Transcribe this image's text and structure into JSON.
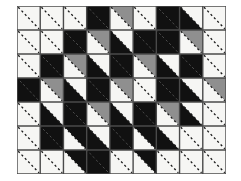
{
  "figure": {
    "type": "geometric-tiling",
    "grid": {
      "columns": 9,
      "rows": 7
    },
    "cell_size_px": 23.2,
    "origin_px": {
      "x": 17,
      "y": 6
    },
    "canvas_px": {
      "width": 241,
      "height": 181
    },
    "colors": {
      "background": "#ffffff",
      "white": "#f6f6f4",
      "gray": "#8f8f8f",
      "black": "#111111",
      "grid_line": "#4a4a4a",
      "dash_line": "#1a1a1a"
    },
    "diagonal_direction": "top-left-to-bottom-right",
    "legend": [
      {
        "key": "W",
        "label": "white triangle",
        "color": "#f6f6f4"
      },
      {
        "key": "G",
        "label": "gray triangle",
        "color": "#8f8f8f"
      },
      {
        "key": "K",
        "label": "black triangle",
        "color": "#111111"
      }
    ],
    "cells": [
      [
        {
          "upper": "W",
          "lower": "W"
        },
        {
          "upper": "W",
          "lower": "W"
        },
        {
          "upper": "W",
          "lower": "W"
        },
        {
          "upper": "K",
          "lower": "K"
        },
        {
          "upper": "G",
          "lower": "W"
        },
        {
          "upper": "W",
          "lower": "W"
        },
        {
          "upper": "K",
          "lower": "K"
        },
        {
          "upper": "W",
          "lower": "K"
        },
        {
          "upper": "W",
          "lower": "W"
        }
      ],
      [
        {
          "upper": "W",
          "lower": "W"
        },
        {
          "upper": "W",
          "lower": "W"
        },
        {
          "upper": "K",
          "lower": "K"
        },
        {
          "upper": "G",
          "lower": "W"
        },
        {
          "upper": "W",
          "lower": "K"
        },
        {
          "upper": "K",
          "lower": "K"
        },
        {
          "upper": "K",
          "lower": "K"
        },
        {
          "upper": "G",
          "lower": "W"
        },
        {
          "upper": "W",
          "lower": "W"
        }
      ],
      [
        {
          "upper": "W",
          "lower": "W"
        },
        {
          "upper": "K",
          "lower": "K"
        },
        {
          "upper": "G",
          "lower": "W"
        },
        {
          "upper": "W",
          "lower": "K"
        },
        {
          "upper": "K",
          "lower": "K"
        },
        {
          "upper": "G",
          "lower": "W"
        },
        {
          "upper": "W",
          "lower": "K"
        },
        {
          "upper": "K",
          "lower": "K"
        },
        {
          "upper": "W",
          "lower": "W"
        }
      ],
      [
        {
          "upper": "K",
          "lower": "K"
        },
        {
          "upper": "G",
          "lower": "W"
        },
        {
          "upper": "W",
          "lower": "K"
        },
        {
          "upper": "K",
          "lower": "K"
        },
        {
          "upper": "G",
          "lower": "W"
        },
        {
          "upper": "W",
          "lower": "W"
        },
        {
          "upper": "K",
          "lower": "K"
        },
        {
          "upper": "W",
          "lower": "K"
        },
        {
          "upper": "G",
          "lower": "W"
        }
      ],
      [
        {
          "upper": "W",
          "lower": "W"
        },
        {
          "upper": "W",
          "lower": "K"
        },
        {
          "upper": "K",
          "lower": "K"
        },
        {
          "upper": "G",
          "lower": "W"
        },
        {
          "upper": "W",
          "lower": "K"
        },
        {
          "upper": "K",
          "lower": "K"
        },
        {
          "upper": "G",
          "lower": "W"
        },
        {
          "upper": "W",
          "lower": "K"
        },
        {
          "upper": "W",
          "lower": "W"
        }
      ],
      [
        {
          "upper": "W",
          "lower": "W"
        },
        {
          "upper": "K",
          "lower": "K"
        },
        {
          "upper": "K",
          "lower": "W"
        },
        {
          "upper": "W",
          "lower": "K"
        },
        {
          "upper": "K",
          "lower": "K"
        },
        {
          "upper": "K",
          "lower": "W"
        },
        {
          "upper": "W",
          "lower": "K"
        },
        {
          "upper": "W",
          "lower": "W"
        },
        {
          "upper": "W",
          "lower": "W"
        }
      ],
      [
        {
          "upper": "W",
          "lower": "W"
        },
        {
          "upper": "W",
          "lower": "W"
        },
        {
          "upper": "K",
          "lower": "W"
        },
        {
          "upper": "K",
          "lower": "K"
        },
        {
          "upper": "W",
          "lower": "W"
        },
        {
          "upper": "K",
          "lower": "W"
        },
        {
          "upper": "W",
          "lower": "W"
        },
        {
          "upper": "W",
          "lower": "W"
        },
        {
          "upper": "W",
          "lower": "W"
        }
      ]
    ]
  }
}
